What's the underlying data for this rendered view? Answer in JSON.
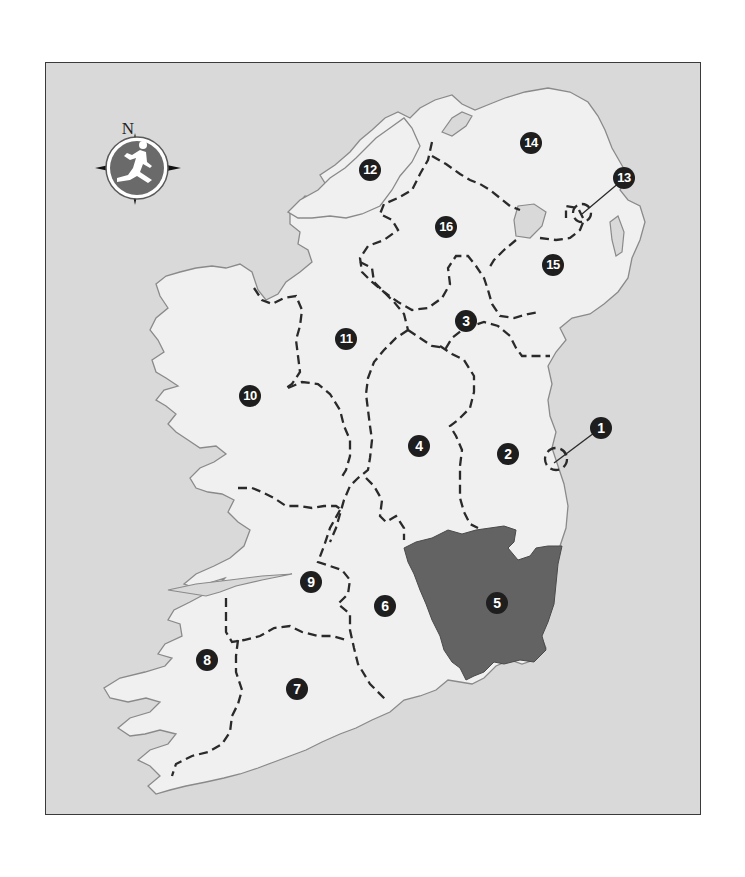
{
  "map": {
    "title": "",
    "compass": {
      "north_label": "N",
      "icon": "running-man-compass-icon"
    },
    "colors": {
      "sea": "#d9d9d9",
      "land": "#f0f0f0",
      "coastline": "#8a8a8a",
      "border": "#2a2a2a",
      "highlight": "#636363",
      "badge": "#1e1e1e"
    },
    "highlighted_region": "5",
    "regions": [
      {
        "id": "1",
        "label": "1",
        "x": 601,
        "y": 428,
        "callout": true
      },
      {
        "id": "2",
        "label": "2",
        "x": 508,
        "y": 454
      },
      {
        "id": "3",
        "label": "3",
        "x": 466,
        "y": 321
      },
      {
        "id": "4",
        "label": "4",
        "x": 419,
        "y": 446
      },
      {
        "id": "5",
        "label": "5",
        "x": 497,
        "y": 603,
        "highlighted": true
      },
      {
        "id": "6",
        "label": "6",
        "x": 385,
        "y": 606
      },
      {
        "id": "7",
        "label": "7",
        "x": 297,
        "y": 689
      },
      {
        "id": "8",
        "label": "8",
        "x": 207,
        "y": 660
      },
      {
        "id": "9",
        "label": "9",
        "x": 311,
        "y": 582
      },
      {
        "id": "10",
        "label": "10",
        "x": 250,
        "y": 396
      },
      {
        "id": "11",
        "label": "11",
        "x": 346,
        "y": 339
      },
      {
        "id": "12",
        "label": "12",
        "x": 370,
        "y": 170
      },
      {
        "id": "13",
        "label": "13",
        "x": 624,
        "y": 178,
        "callout": true
      },
      {
        "id": "14",
        "label": "14",
        "x": 531,
        "y": 143
      },
      {
        "id": "15",
        "label": "15",
        "x": 553,
        "y": 265
      },
      {
        "id": "16",
        "label": "16",
        "x": 446,
        "y": 227
      }
    ]
  }
}
